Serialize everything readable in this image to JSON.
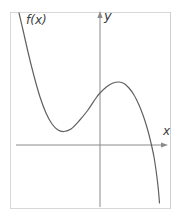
{
  "labels": {
    "function": "f(x)",
    "x_axis": "x",
    "y_axis": "y"
  },
  "colors": {
    "curve": "#606060",
    "axis": "#8a8a8a",
    "frame": "#d7d7d7",
    "text": "#3c3c3c",
    "background": "#ffffff"
  },
  "chart_data": {
    "type": "line",
    "title": "",
    "xlabel": "x",
    "ylabel": "y",
    "legend": "none",
    "grid": false,
    "tick_labels": "none",
    "series": [
      {
        "name": "f(x)",
        "shape": "cubic-like, negative leading coefficient, single x-intercept",
        "points_px": [
          [
            19,
            13
          ],
          [
            23,
            30
          ],
          [
            28,
            52
          ],
          [
            34,
            76
          ],
          [
            40,
            97
          ],
          [
            46,
            113
          ],
          [
            52,
            124
          ],
          [
            58,
            130
          ],
          [
            64,
            131.5
          ],
          [
            71,
            129
          ],
          [
            79,
            121
          ],
          [
            88,
            110
          ],
          [
            96,
            98
          ],
          [
            100,
            93
          ],
          [
            107,
            86.5
          ],
          [
            113,
            83
          ],
          [
            119,
            82
          ],
          [
            124,
            83.5
          ],
          [
            129,
            88
          ],
          [
            134,
            95
          ],
          [
            139,
            105
          ],
          [
            144,
            118
          ],
          [
            148,
            131
          ],
          [
            151,
            143
          ],
          [
            154,
            157
          ],
          [
            156,
            170
          ],
          [
            158,
            186
          ],
          [
            159.5,
            203
          ]
        ]
      }
    ],
    "axes_px": {
      "y_axis": {
        "x": 100,
        "y_top": 11,
        "y_bottom": 207
      },
      "x_axis": {
        "y": 145,
        "x_left": 16,
        "x_right": 168
      }
    },
    "features": {
      "local_min_px": [
        64,
        131.5
      ],
      "local_max_px": [
        119,
        82
      ],
      "y_intercept_px": [
        100,
        93
      ],
      "x_intercept_px": [
        151.5,
        145
      ]
    }
  }
}
